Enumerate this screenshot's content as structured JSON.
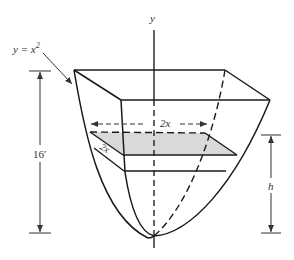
{
  "figure": {
    "axis_label": "y",
    "curve_label": "y = x²",
    "curve_label_base": "y = x",
    "curve_label_exp": "2",
    "depth_label": "16′",
    "width_label_top": "2x",
    "width_label_side": "2x",
    "height_label": "h",
    "colors": {
      "stroke": "#1a1a1a",
      "dim_stroke": "#555555",
      "shade": "#d9d9d9",
      "background": "#ffffff"
    }
  }
}
